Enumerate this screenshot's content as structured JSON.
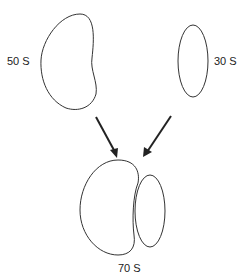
{
  "diagram": {
    "subunits": [
      {
        "id": "large",
        "label": "50 S"
      },
      {
        "id": "small",
        "label": "30 S"
      }
    ],
    "assembled": {
      "label": "70 S"
    },
    "colors": {
      "stroke": "#333333",
      "arrow": "#222222",
      "text": "#222222"
    }
  }
}
